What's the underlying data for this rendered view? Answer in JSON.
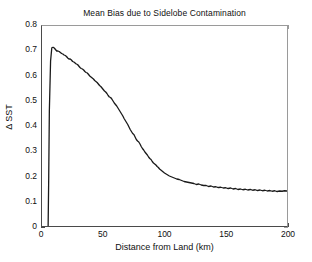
{
  "chart_data": {
    "type": "line",
    "title": "Mean Bias due to Sidelobe Contamination",
    "xlabel": "Distance from Land (km)",
    "ylabel": "Δ SST",
    "xlim": [
      0,
      200
    ],
    "ylim": [
      0,
      0.8
    ],
    "xticks": [
      0,
      50,
      100,
      150,
      200
    ],
    "xtick_labels": [
      "0",
      "50",
      "100",
      "150",
      "200"
    ],
    "yticks": [
      0,
      0.1,
      0.2,
      0.3,
      0.4,
      0.5,
      0.6,
      0.7,
      0.8
    ],
    "ytick_labels": [
      "0",
      "0.1",
      "0.2",
      "0.3",
      "0.4",
      "0.5",
      "0.6",
      "0.7",
      "0.8"
    ],
    "grid": false,
    "legend": null,
    "line_color": "#1a1a1a",
    "line_width": 1.3,
    "series": [
      {
        "name": "Mean bias",
        "x": [
          5,
          5.5,
          6,
          7,
          8,
          9,
          10,
          11,
          12,
          13,
          14,
          15,
          16,
          17,
          18,
          19,
          20,
          21,
          22,
          23,
          24,
          25,
          26,
          27,
          28,
          29,
          30,
          31,
          32,
          33,
          34,
          35,
          36,
          37,
          38,
          39,
          40,
          41,
          42,
          43,
          44,
          45,
          46,
          47,
          48,
          49,
          50,
          51,
          52,
          53,
          54,
          55,
          56,
          57,
          58,
          59,
          60,
          61,
          62,
          63,
          64,
          65,
          66,
          67,
          68,
          69,
          70,
          71,
          72,
          73,
          74,
          75,
          76,
          77,
          78,
          79,
          80,
          81,
          82,
          83,
          84,
          85,
          86,
          87,
          88,
          89,
          90,
          91,
          92,
          93,
          94,
          95,
          96,
          97,
          98,
          99,
          100,
          102,
          104,
          106,
          108,
          110,
          112,
          114,
          116,
          118,
          120,
          122,
          124,
          126,
          128,
          130,
          132,
          134,
          136,
          138,
          140,
          142,
          144,
          146,
          148,
          150,
          152,
          154,
          156,
          158,
          160,
          162,
          164,
          166,
          168,
          170,
          172,
          174,
          176,
          178,
          180,
          182,
          184,
          186,
          188,
          190,
          192,
          194,
          196,
          198,
          200
        ],
        "y": [
          0.0,
          0.2,
          0.46,
          0.66,
          0.713,
          0.715,
          0.712,
          0.706,
          0.7,
          0.7,
          0.698,
          0.694,
          0.69,
          0.688,
          0.684,
          0.682,
          0.678,
          0.672,
          0.668,
          0.668,
          0.664,
          0.658,
          0.656,
          0.652,
          0.648,
          0.646,
          0.64,
          0.634,
          0.63,
          0.628,
          0.624,
          0.618,
          0.614,
          0.612,
          0.606,
          0.6,
          0.596,
          0.592,
          0.588,
          0.582,
          0.578,
          0.574,
          0.568,
          0.562,
          0.558,
          0.552,
          0.546,
          0.54,
          0.536,
          0.53,
          0.522,
          0.516,
          0.514,
          0.508,
          0.5,
          0.492,
          0.486,
          0.48,
          0.472,
          0.464,
          0.456,
          0.448,
          0.44,
          0.43,
          0.422,
          0.414,
          0.406,
          0.396,
          0.386,
          0.378,
          0.37,
          0.366,
          0.356,
          0.346,
          0.34,
          0.336,
          0.328,
          0.318,
          0.31,
          0.304,
          0.296,
          0.29,
          0.284,
          0.276,
          0.27,
          0.266,
          0.258,
          0.252,
          0.248,
          0.244,
          0.238,
          0.234,
          0.228,
          0.224,
          0.22,
          0.216,
          0.212,
          0.206,
          0.2,
          0.196,
          0.192,
          0.188,
          0.186,
          0.182,
          0.178,
          0.176,
          0.174,
          0.172,
          0.17,
          0.166,
          0.168,
          0.164,
          0.162,
          0.162,
          0.158,
          0.16,
          0.156,
          0.157,
          0.154,
          0.155,
          0.152,
          0.153,
          0.15,
          0.152,
          0.148,
          0.15,
          0.146,
          0.148,
          0.145,
          0.147,
          0.144,
          0.146,
          0.143,
          0.145,
          0.142,
          0.144,
          0.141,
          0.143,
          0.14,
          0.142,
          0.139,
          0.141,
          0.138,
          0.14,
          0.139,
          0.141,
          0.14
        ]
      }
    ]
  }
}
